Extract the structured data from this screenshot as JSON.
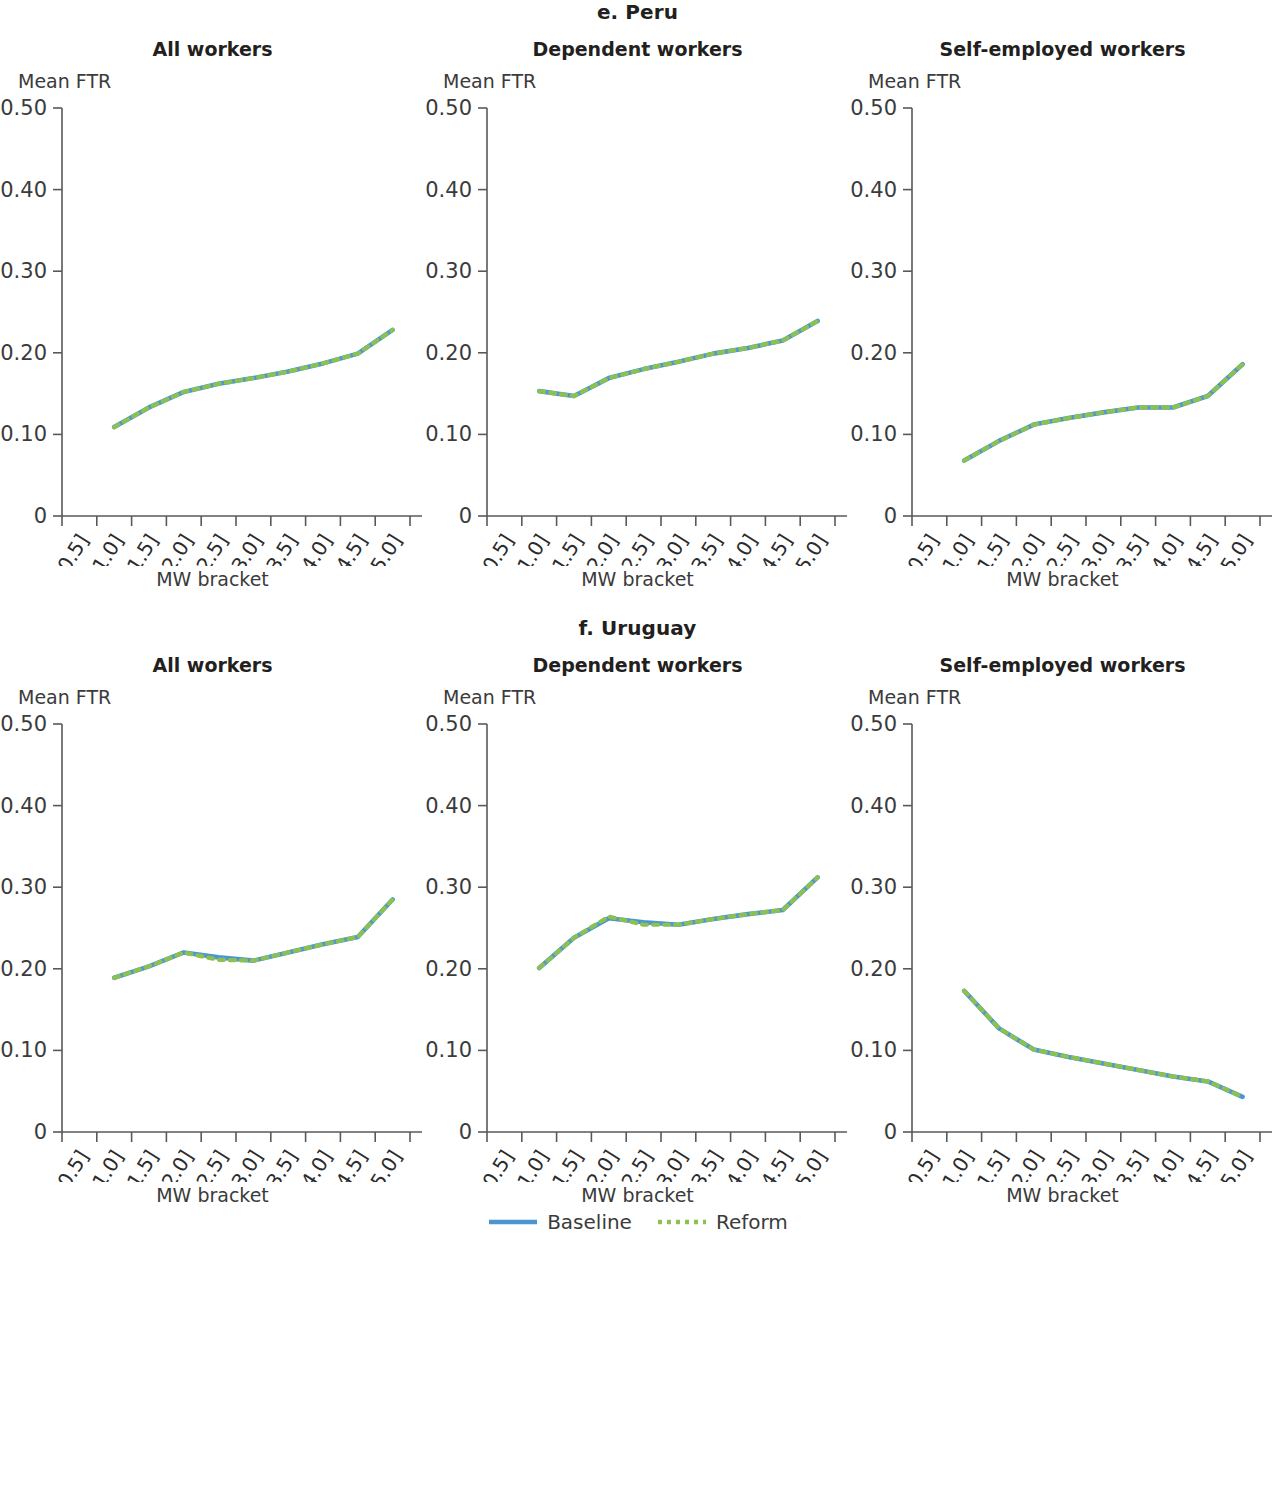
{
  "figure": {
    "sections": [
      {
        "title": "e. Peru"
      },
      {
        "title": "f. Uruguay"
      }
    ],
    "panel_titles": {
      "all": "All workers",
      "dependent": "Dependent workers",
      "self_employed": "Self-employed workers"
    },
    "axis_labels": {
      "y": "Mean FTR",
      "x": "MW bracket"
    },
    "y_ticks": [
      "0.50",
      "0.40",
      "0.30",
      "0.20",
      "0.10",
      "0"
    ],
    "x_ticks": [
      "[0, 0.5]",
      "[0.5, 1.0]",
      "[1.0, 1.5]",
      "[1.5, 2.0]",
      "[2.0, 2.5]",
      "[2.5, 3.0]",
      "[3.0, 3.5]",
      "[3.5, 4.0]",
      "[4.0, 4.5]",
      "[4.5, 5.0]"
    ],
    "legend": {
      "baseline_label": "Baseline",
      "reform_label": "Reform"
    },
    "colors": {
      "baseline": "#4a96d2",
      "reform": "#8cc152",
      "axis": "#58595b",
      "text": "#231f20"
    }
  },
  "chart_data": [
    {
      "type": "line",
      "title": "All workers",
      "section": "e. Peru",
      "xlabel": "MW bracket",
      "ylabel": "Mean FTR",
      "ylim": [
        0,
        0.5
      ],
      "yticks": [
        0,
        0.1,
        0.2,
        0.3,
        0.4,
        0.5
      ],
      "grid": false,
      "legend_position": "bottom-center",
      "categories": [
        "[0, 0.5]",
        "[0.5, 1.0]",
        "[1.0, 1.5]",
        "[1.5, 2.0]",
        "[2.0, 2.5]",
        "[2.5, 3.0]",
        "[3.0, 3.5]",
        "[3.5, 4.0]",
        "[4.0, 4.5]",
        "[4.5, 5.0]"
      ],
      "series": [
        {
          "name": "Baseline",
          "values": [
            null,
            0.109,
            0.133,
            0.152,
            0.162,
            0.169,
            0.177,
            0.187,
            0.199,
            0.228
          ]
        },
        {
          "name": "Reform",
          "values": [
            null,
            0.109,
            0.133,
            0.152,
            0.162,
            0.169,
            0.177,
            0.187,
            0.199,
            0.228
          ]
        }
      ]
    },
    {
      "type": "line",
      "title": "Dependent workers",
      "section": "e. Peru",
      "xlabel": "MW bracket",
      "ylabel": "Mean FTR",
      "ylim": [
        0,
        0.5
      ],
      "yticks": [
        0,
        0.1,
        0.2,
        0.3,
        0.4,
        0.5
      ],
      "grid": false,
      "legend_position": "bottom-center",
      "categories": [
        "[0, 0.5]",
        "[0.5, 1.0]",
        "[1.0, 1.5]",
        "[1.5, 2.0]",
        "[2.0, 2.5]",
        "[2.5, 3.0]",
        "[3.0, 3.5]",
        "[3.5, 4.0]",
        "[4.0, 4.5]",
        "[4.5, 5.0]"
      ],
      "series": [
        {
          "name": "Baseline",
          "values": [
            null,
            0.153,
            0.147,
            0.169,
            0.18,
            0.189,
            0.199,
            0.206,
            0.215,
            0.239
          ]
        },
        {
          "name": "Reform",
          "values": [
            null,
            0.153,
            0.147,
            0.169,
            0.18,
            0.189,
            0.199,
            0.206,
            0.215,
            0.239
          ]
        }
      ]
    },
    {
      "type": "line",
      "title": "Self-employed workers",
      "section": "e. Peru",
      "xlabel": "MW bracket",
      "ylabel": "Mean FTR",
      "ylim": [
        0,
        0.5
      ],
      "yticks": [
        0,
        0.1,
        0.2,
        0.3,
        0.4,
        0.5
      ],
      "grid": false,
      "legend_position": "bottom-center",
      "categories": [
        "[0, 0.5]",
        "[0.5, 1.0]",
        "[1.0, 1.5]",
        "[1.5, 2.0]",
        "[2.0, 2.5]",
        "[2.5, 3.0]",
        "[3.0, 3.5]",
        "[3.5, 4.0]",
        "[4.0, 4.5]",
        "[4.5, 5.0]"
      ],
      "series": [
        {
          "name": "Baseline",
          "values": [
            null,
            0.068,
            0.092,
            0.112,
            0.12,
            0.127,
            0.133,
            0.133,
            0.147,
            0.186
          ]
        },
        {
          "name": "Reform",
          "values": [
            null,
            0.068,
            0.092,
            0.112,
            0.12,
            0.127,
            0.133,
            0.133,
            0.147,
            0.186
          ]
        }
      ]
    },
    {
      "type": "line",
      "title": "All workers",
      "section": "f. Uruguay",
      "xlabel": "MW bracket",
      "ylabel": "Mean FTR",
      "ylim": [
        0,
        0.5
      ],
      "yticks": [
        0,
        0.1,
        0.2,
        0.3,
        0.4,
        0.5
      ],
      "grid": false,
      "legend_position": "bottom-center",
      "categories": [
        "[0, 0.5]",
        "[0.5, 1.0]",
        "[1.0, 1.5]",
        "[1.5, 2.0]",
        "[2.0, 2.5]",
        "[2.5, 3.0]",
        "[3.0, 3.5]",
        "[3.5, 4.0]",
        "[4.0, 4.5]",
        "[4.5, 5.0]"
      ],
      "series": [
        {
          "name": "Baseline",
          "values": [
            null,
            0.189,
            0.203,
            0.22,
            0.214,
            0.21,
            0.22,
            0.23,
            0.239,
            0.285
          ]
        },
        {
          "name": "Reform",
          "values": [
            null,
            0.189,
            0.203,
            0.22,
            0.211,
            0.21,
            0.22,
            0.23,
            0.239,
            0.285
          ]
        }
      ]
    },
    {
      "type": "line",
      "title": "Dependent workers",
      "section": "f. Uruguay",
      "xlabel": "MW bracket",
      "ylabel": "Mean FTR",
      "ylim": [
        0,
        0.5
      ],
      "yticks": [
        0,
        0.1,
        0.2,
        0.3,
        0.4,
        0.5
      ],
      "grid": false,
      "legend_position": "bottom-center",
      "categories": [
        "[0, 0.5]",
        "[0.5, 1.0]",
        "[1.0, 1.5]",
        "[1.5, 2.0]",
        "[2.0, 2.5]",
        "[2.5, 3.0]",
        "[3.0, 3.5]",
        "[3.5, 4.0]",
        "[4.0, 4.5]",
        "[4.5, 5.0]"
      ],
      "series": [
        {
          "name": "Baseline",
          "values": [
            null,
            0.201,
            0.238,
            0.262,
            0.257,
            0.254,
            0.261,
            0.267,
            0.272,
            0.312
          ]
        },
        {
          "name": "Reform",
          "values": [
            null,
            0.201,
            0.238,
            0.264,
            0.254,
            0.254,
            0.261,
            0.267,
            0.272,
            0.312
          ]
        }
      ]
    },
    {
      "type": "line",
      "title": "Self-employed workers",
      "section": "f. Uruguay",
      "xlabel": "MW bracket",
      "ylabel": "Mean FTR",
      "ylim": [
        0,
        0.5
      ],
      "yticks": [
        0,
        0.1,
        0.2,
        0.3,
        0.4,
        0.5
      ],
      "grid": false,
      "legend_position": "bottom-center",
      "categories": [
        "[0, 0.5]",
        "[0.5, 1.0]",
        "[1.0, 1.5]",
        "[1.5, 2.0]",
        "[2.0, 2.5]",
        "[2.5, 3.0]",
        "[3.0, 3.5]",
        "[3.5, 4.0]",
        "[4.0, 4.5]",
        "[4.5, 5.0]"
      ],
      "series": [
        {
          "name": "Baseline",
          "values": [
            null,
            0.173,
            0.127,
            0.101,
            0.092,
            0.084,
            0.076,
            0.068,
            0.062,
            0.043
          ]
        },
        {
          "name": "Reform",
          "values": [
            null,
            0.173,
            0.127,
            0.101,
            0.092,
            0.084,
            0.076,
            0.068,
            0.062,
            0.043
          ]
        }
      ]
    }
  ]
}
